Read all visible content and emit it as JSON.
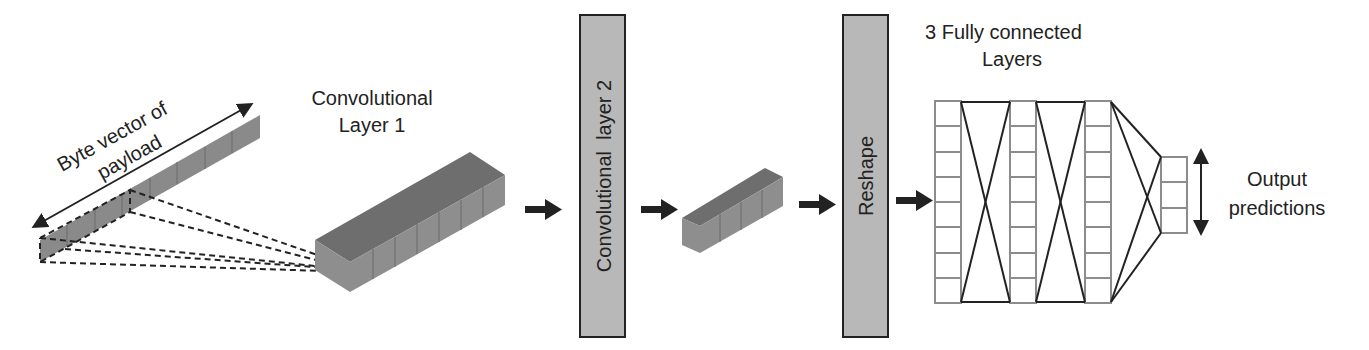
{
  "labels": {
    "byte_vector_line1": "Byte vector of",
    "byte_vector_line2": "payload",
    "conv1_line1": "Convolutional",
    "conv1_line2": "Layer 1",
    "conv2": "Convolutional  layer 2",
    "reshape": "Reshape",
    "fc_line1": "3 Fully connected",
    "fc_line2": "Layers",
    "output_line1": "Output",
    "output_line2": "predictions"
  },
  "colors": {
    "block_front": "#8a8a8a",
    "block_top": "#6e6e6e",
    "layer_fill": "#b8b8b8",
    "stroke": "#222222",
    "grid_stroke": "#8c8c8c"
  },
  "fc_layers": {
    "hidden_cells": 8,
    "output_cells": 3,
    "hidden_columns": 3
  }
}
